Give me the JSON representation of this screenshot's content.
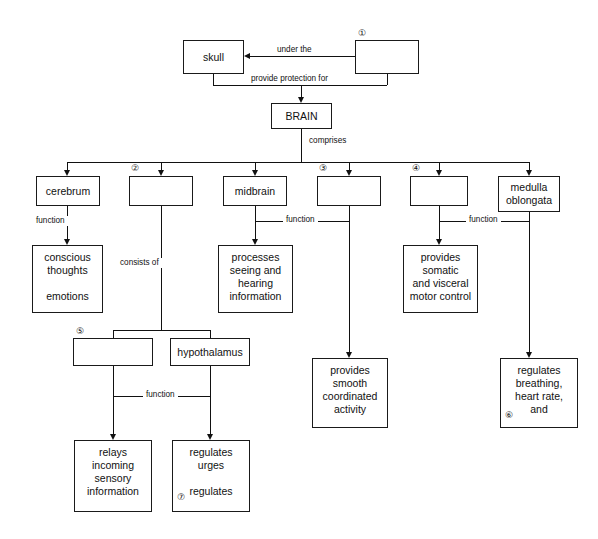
{
  "diagram": {
    "colors": {
      "line": "#111111",
      "box_border": "#1a1a1a",
      "background": "#ffffff",
      "text": "#111111"
    },
    "nodes": {
      "skull": {
        "label": "skull"
      },
      "blank1": {
        "label": "",
        "marker": "①"
      },
      "brain": {
        "label": "BRAIN"
      },
      "cerebrum": {
        "label": "cerebrum"
      },
      "blank2": {
        "label": "",
        "marker": "②"
      },
      "midbrain": {
        "label": "midbrain"
      },
      "blank3": {
        "label": "",
        "marker": "③"
      },
      "blank4": {
        "label": "",
        "marker": "④"
      },
      "medulla": {
        "label": "medulla\noblongata"
      },
      "conscious": {
        "label": "conscious\nthoughts\n\nemotions"
      },
      "processes": {
        "label": "processes\nseeing and\nhearing\ninformation"
      },
      "somatic": {
        "label": "provides\nsomatic\nand visceral\nmotor control"
      },
      "smooth": {
        "label": "provides\nsmooth\ncoordinated\nactivity"
      },
      "breathing": {
        "label": "regulates\nbreathing,\nheart rate,\nand",
        "marker": "⑥"
      },
      "blank5": {
        "label": "",
        "marker": "⑤"
      },
      "hypothalamus": {
        "label": "hypothalamus"
      },
      "relays": {
        "label": "relays\nincoming\nsensory\ninformation"
      },
      "urges": {
        "label": "regulates\nurges\n\nregulates",
        "marker": "⑦"
      }
    },
    "edges": {
      "under_the": "under the",
      "provide_protection_for": "provide protection for",
      "comprises": "comprises",
      "function_cerebrum": "function",
      "consists_of": "consists of",
      "function_midbrain": "function",
      "function_blank4": "function",
      "function_blank5": "function"
    }
  }
}
